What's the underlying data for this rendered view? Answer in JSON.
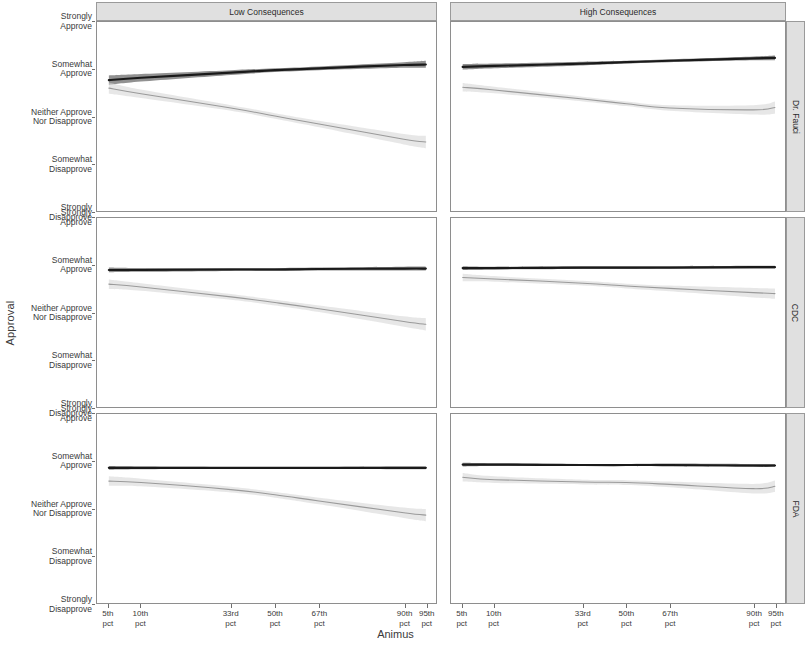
{
  "chart_data": {
    "type": "line",
    "title": "",
    "xlabel": "Animus",
    "ylabel": "Approval",
    "grid": false,
    "legend_position": "none",
    "facet_cols": [
      "Low Consequences",
      "High Consequences"
    ],
    "facet_rows": [
      "Dr. Fauci",
      "CDC",
      "FDA"
    ],
    "x": [
      5,
      10,
      33,
      50,
      67,
      90,
      95
    ],
    "xtick_labels": [
      "5th\npct",
      "10th\npct",
      "33rd\npct",
      "50th\npct",
      "67th\npct",
      "90th\npct",
      "95th\npct"
    ],
    "xtick_labels_line1": [
      "5th",
      "10th",
      "33rd",
      "50th",
      "67th",
      "90th",
      "95th"
    ],
    "xtick_labels_line2": [
      "pct",
      "pct",
      "pct",
      "pct",
      "pct",
      "pct",
      "pct"
    ],
    "xtick_positions_pct": [
      3.5,
      13.0,
      39.5,
      52.5,
      65.5,
      90.5,
      97.0
    ],
    "ylim": [
      1,
      5
    ],
    "ytick_values": [
      5,
      4,
      3,
      2,
      1
    ],
    "ytick_labels": [
      "Strongly\nApprove",
      "Somewhat\nApprove",
      "Neither Approve\nNor Disapprove",
      "Somewhat\nDisapprove",
      "Strongly\nDisapprove"
    ],
    "ytick_labels_line1": [
      "Strongly",
      "Somewhat",
      "Neither Approve",
      "Somewhat",
      "Strongly"
    ],
    "ytick_labels_line2": [
      "Approve",
      "Approve",
      "Nor Disapprove",
      "Disapprove",
      "Disapprove"
    ],
    "colors": {
      "line_dark": "#1a1a1a",
      "ribbon_dark": "#666666",
      "line_light": "#9a9a9a",
      "ribbon_light": "#d4d4d4",
      "panel_border": "#8e8e8e",
      "strip_background": "#e0e0e0",
      "strip_border": "#9a9a9a",
      "axis_text": "#3a3a3a",
      "background": "#ffffff"
    },
    "series": [
      {
        "name": "Dark series",
        "color": "#1a1a1a",
        "ribbon_color": "#666666",
        "panels": {
          "Dr. Fauci|Low Consequences": {
            "values": [
              3.77,
              3.82,
              3.93,
              3.98,
              4.02,
              4.09,
              4.1
            ],
            "lower": [
              3.67,
              3.74,
              3.88,
              3.94,
              3.98,
              4.03,
              4.03
            ],
            "upper": [
              3.87,
              3.9,
              3.98,
              4.02,
              4.06,
              4.15,
              4.18
            ]
          },
          "Dr. Fauci|High Consequences": {
            "values": [
              4.05,
              4.07,
              4.12,
              4.15,
              4.18,
              4.23,
              4.24
            ],
            "lower": [
              3.99,
              4.02,
              4.08,
              4.12,
              4.15,
              4.19,
              4.19
            ],
            "upper": [
              4.11,
              4.12,
              4.16,
              4.18,
              4.21,
              4.27,
              4.29
            ]
          },
          "CDC|Low Consequences": {
            "values": [
              3.9,
              3.9,
              3.91,
              3.91,
              3.92,
              3.93,
              3.93
            ],
            "lower": [
              3.85,
              3.86,
              3.88,
              3.88,
              3.89,
              3.89,
              3.89
            ],
            "upper": [
              3.95,
              3.94,
              3.94,
              3.94,
              3.95,
              3.97,
              3.97
            ]
          },
          "CDC|High Consequences": {
            "values": [
              3.94,
              3.94,
              3.95,
              3.95,
              3.95,
              3.96,
              3.96
            ],
            "lower": [
              3.9,
              3.91,
              3.92,
              3.92,
              3.93,
              3.93,
              3.93
            ],
            "upper": [
              3.98,
              3.97,
              3.98,
              3.98,
              3.98,
              3.99,
              3.99
            ]
          },
          "FDA|Low Consequences": {
            "values": [
              3.86,
              3.86,
              3.86,
              3.86,
              3.86,
              3.86,
              3.86
            ],
            "lower": [
              3.82,
              3.83,
              3.84,
              3.84,
              3.84,
              3.83,
              3.83
            ],
            "upper": [
              3.9,
              3.89,
              3.88,
              3.88,
              3.88,
              3.89,
              3.89
            ]
          },
          "FDA|High Consequences": {
            "values": [
              3.93,
              3.93,
              3.92,
              3.92,
              3.92,
              3.91,
              3.91
            ],
            "lower": [
              3.89,
              3.9,
              3.9,
              3.9,
              3.89,
              3.88,
              3.88
            ],
            "upper": [
              3.97,
              3.96,
              3.94,
              3.94,
              3.95,
              3.94,
              3.94
            ]
          }
        }
      },
      {
        "name": "Light series",
        "color": "#9a9a9a",
        "ribbon_color": "#d4d4d4",
        "panels": {
          "Dr. Fauci|Low Consequences": {
            "values": [
              3.6,
              3.48,
              3.18,
              3.01,
              2.84,
              2.52,
              2.46
            ],
            "lower": [
              3.48,
              3.39,
              3.12,
              2.95,
              2.77,
              2.41,
              2.33
            ],
            "upper": [
              3.72,
              3.57,
              3.24,
              3.07,
              2.91,
              2.63,
              2.59
            ]
          },
          "Dr. Fauci|High Consequences": {
            "values": [
              3.62,
              3.56,
              3.37,
              3.27,
              3.18,
              3.14,
              3.19
            ],
            "lower": [
              3.53,
              3.49,
              3.32,
              3.22,
              3.12,
              3.04,
              3.06
            ],
            "upper": [
              3.71,
              3.63,
              3.42,
              3.32,
              3.24,
              3.24,
              3.32
            ]
          },
          "CDC|Low Consequences": {
            "values": [
              3.6,
              3.54,
              3.33,
              3.21,
              3.08,
              2.81,
              2.75
            ],
            "lower": [
              3.5,
              3.46,
              3.27,
              3.15,
              3.01,
              2.7,
              2.62
            ],
            "upper": [
              3.7,
              3.62,
              3.39,
              3.27,
              3.15,
              2.92,
              2.88
            ]
          },
          "CDC|High Consequences": {
            "values": [
              3.74,
              3.71,
              3.62,
              3.56,
              3.51,
              3.42,
              3.4
            ],
            "lower": [
              3.66,
              3.65,
              3.57,
              3.51,
              3.45,
              3.32,
              3.29
            ],
            "upper": [
              3.82,
              3.77,
              3.67,
              3.61,
              3.57,
              3.52,
              3.51
            ]
          },
          "FDA|Low Consequences": {
            "values": [
              3.58,
              3.55,
              3.4,
              3.29,
              3.16,
              2.91,
              2.86
            ],
            "lower": [
              3.48,
              3.47,
              3.34,
              3.23,
              3.09,
              2.8,
              2.73
            ],
            "upper": [
              3.68,
              3.63,
              3.46,
              3.35,
              3.23,
              3.02,
              2.99
            ]
          },
          "FDA|High Consequences": {
            "values": [
              3.66,
              3.61,
              3.56,
              3.55,
              3.51,
              3.42,
              3.47
            ],
            "lower": [
              3.57,
              3.54,
              3.51,
              3.5,
              3.45,
              3.32,
              3.35
            ],
            "upper": [
              3.75,
              3.68,
              3.61,
              3.6,
              3.57,
              3.52,
              3.59
            ]
          }
        }
      }
    ]
  },
  "axes": {
    "y_title": "Approval",
    "x_title": "Animus"
  }
}
